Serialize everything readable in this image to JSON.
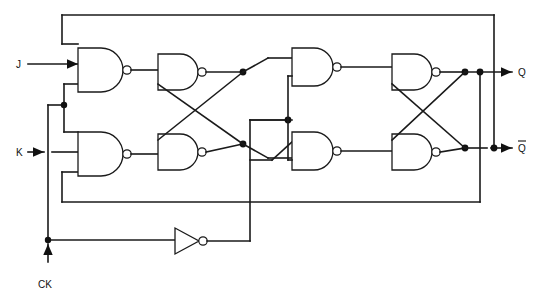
{
  "diagram": {
    "type": "logic-circuit-schematic",
    "background_color": "#ffffff",
    "line_color": "#1a1a1a"
  },
  "labels": {
    "input_j": "J",
    "input_k": "K",
    "input_ck": "CK",
    "output_q": "Q",
    "output_qbar": "Q",
    "output_qbar_overbar": "̅"
  },
  "ports": [
    {
      "name": "J",
      "kind": "input",
      "x": 20,
      "y": 64
    },
    {
      "name": "K",
      "kind": "input",
      "x": 20,
      "y": 152
    },
    {
      "name": "CK",
      "kind": "input",
      "x": 48,
      "y": 272
    },
    {
      "name": "Q",
      "kind": "output",
      "x": 520,
      "y": 72
    },
    {
      "name": "Qbar",
      "kind": "output",
      "x": 520,
      "y": 148
    }
  ],
  "gates": [
    {
      "id": "nand1",
      "type": "NAND",
      "inputs": 3,
      "x": 78,
      "y": 48,
      "w": 45,
      "h": 44,
      "label": "master-input-nand-top"
    },
    {
      "id": "nand2",
      "type": "NAND",
      "inputs": 3,
      "x": 78,
      "y": 132,
      "w": 45,
      "h": 44,
      "label": "master-input-nand-bottom"
    },
    {
      "id": "nand3",
      "type": "NAND",
      "inputs": 2,
      "x": 158,
      "y": 54,
      "w": 44,
      "h": 36,
      "label": "master-latch-nand-top"
    },
    {
      "id": "nand4",
      "type": "NAND",
      "inputs": 2,
      "x": 158,
      "y": 134,
      "w": 44,
      "h": 36,
      "label": "master-latch-nand-bottom"
    },
    {
      "id": "nand5",
      "type": "NAND",
      "inputs": 2,
      "x": 292,
      "y": 48,
      "w": 44,
      "h": 38,
      "label": "slave-input-nand-top"
    },
    {
      "id": "nand6",
      "type": "NAND",
      "inputs": 2,
      "x": 292,
      "y": 132,
      "w": 44,
      "h": 38,
      "label": "slave-input-nand-bottom"
    },
    {
      "id": "nand7",
      "type": "NAND",
      "inputs": 2,
      "x": 392,
      "y": 54,
      "w": 44,
      "h": 36,
      "label": "slave-latch-nand-top"
    },
    {
      "id": "nand8",
      "type": "NAND",
      "inputs": 2,
      "x": 392,
      "y": 134,
      "w": 44,
      "h": 36,
      "label": "slave-latch-nand-bottom"
    },
    {
      "id": "inv1",
      "type": "NOT",
      "inputs": 1,
      "x": 175,
      "y": 228,
      "w": 30,
      "h": 26,
      "label": "clock-inverter"
    }
  ],
  "junction_count": 10,
  "notes": {
    "master_section": "left half clocked by CK",
    "slave_section": "right half clocked by inverted CK",
    "feedback_top": "Qbar feeds back to top master input NAND",
    "feedback_bottom": "Q feeds back to bottom master input NAND"
  }
}
